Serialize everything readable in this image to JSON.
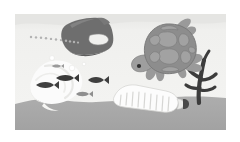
{
  "scene": {
    "title": "Ocean Plastic Pollution",
    "description": "Underwater scene with a sea turtle, fish, seaweed and floating plastic waste resting above a sandy seabed.",
    "canvas": {
      "width": 240,
      "height": 142
    },
    "frame": {
      "x": 15,
      "y": 14,
      "width": 211,
      "height": 116
    },
    "palette": {
      "page_background": "#ffffff",
      "water": "#f2f2f0",
      "water_surface": "#e9e9e7",
      "seabed_sand": "#a8a8a8",
      "turtle_shell": "#8d8d8d",
      "turtle_shell_plate": "#a0a0a0",
      "turtle_body": "#9a9a9a",
      "turtle_outline": "#7a7a7a",
      "jug_body": "#6e6e6e",
      "jug_shadow": "#5f5f5f",
      "plastic_bag": "#fcfcfc",
      "plastic_bag_shade": "#ededeb",
      "bottle_body": "#fbfbfb",
      "bottle_rib": "#d8d8d6",
      "bottle_cap": "#4a4a4a",
      "seaweed": "#3c3c3c",
      "fish_dark": "#3f3f3f",
      "fish_mid": "#8e8e8e",
      "bubble_trail": "#b5b5b5",
      "bubble": "#fafafa"
    }
  },
  "objects": {
    "water_body": {
      "label": "Ocean water",
      "kind": "background"
    },
    "seabed": {
      "label": "Sandy seabed",
      "kind": "background",
      "top_y": 97
    },
    "turtle": {
      "label": "Sea turtle",
      "kind": "animal",
      "facing": "left",
      "shell_plate_count": 9,
      "flipper_count": 4
    },
    "plastic_jug": {
      "label": "Plastic jug container",
      "kind": "waste",
      "material": "plastic",
      "has_handle": true
    },
    "plastic_bag": {
      "label": "Floating plastic bag",
      "kind": "waste",
      "material": "plastic"
    },
    "plastic_bottle": {
      "label": "Ribbed plastic bottle",
      "kind": "waste",
      "material": "plastic",
      "rib_count": 9,
      "has_cap": true
    },
    "seaweed": {
      "label": "Seaweed plant",
      "kind": "plant",
      "branch_count": 5
    },
    "bubble_trail": {
      "label": "Bubble trail",
      "kind": "effect",
      "bubble_count": 11
    },
    "fish": {
      "label": "Fish school",
      "kind": "animal",
      "count": 5,
      "items": [
        {
          "label": "fish-1",
          "x": 40,
          "y": 85,
          "length": 13,
          "facing": "left",
          "tone": "fish_dark"
        },
        {
          "label": "fish-2",
          "x": 60,
          "y": 78,
          "length": 13,
          "facing": "left",
          "tone": "fish_dark"
        },
        {
          "label": "fish-3",
          "x": 92,
          "y": 80,
          "length": 12,
          "facing": "left",
          "tone": "fish_dark"
        },
        {
          "label": "fish-4",
          "x": 80,
          "y": 94,
          "length": 10,
          "facing": "left",
          "tone": "fish_mid"
        },
        {
          "label": "fish-5",
          "x": 55,
          "y": 66,
          "length": 8,
          "facing": "left",
          "tone": "fish_mid"
        }
      ]
    },
    "bubbles_small": {
      "label": "Rising bubbles",
      "kind": "effect",
      "count": 3
    }
  }
}
